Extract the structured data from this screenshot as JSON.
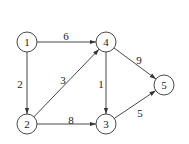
{
  "graph": {
    "type": "directed-weighted",
    "nodes": [
      {
        "id": "1",
        "label": "1",
        "x": 27,
        "y": 42
      },
      {
        "id": "2",
        "label": "2",
        "x": 27,
        "y": 124
      },
      {
        "id": "3",
        "label": "3",
        "x": 106,
        "y": 124
      },
      {
        "id": "4",
        "label": "4",
        "x": 106,
        "y": 42
      },
      {
        "id": "5",
        "label": "5",
        "x": 164,
        "y": 85
      }
    ],
    "edges": [
      {
        "from": "1",
        "to": "4",
        "weight": "6",
        "lx": 66,
        "ly": 36
      },
      {
        "from": "1",
        "to": "2",
        "weight": "2",
        "lx": 20,
        "ly": 84
      },
      {
        "from": "2",
        "to": "4",
        "weight": "3",
        "lx": 63,
        "ly": 80
      },
      {
        "from": "2",
        "to": "3",
        "weight": "8",
        "lx": 71,
        "ly": 120
      },
      {
        "from": "4",
        "to": "3",
        "weight": "1",
        "lx": 101,
        "ly": 84
      },
      {
        "from": "4",
        "to": "5",
        "weight": "9",
        "lx": 139,
        "ly": 60
      },
      {
        "from": "3",
        "to": "5",
        "weight": "5",
        "lx": 140,
        "ly": 113
      }
    ]
  }
}
